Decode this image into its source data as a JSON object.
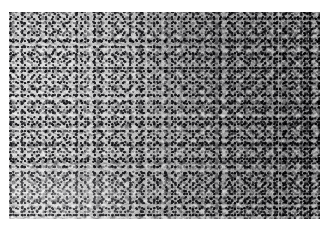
{
  "figure": {
    "kind": "histopathology-micrograph",
    "stain": "H&E",
    "rendering": "grayscale",
    "caption": "",
    "label": "",
    "scale_bar_text": "",
    "magnification_text": ""
  },
  "plate": {
    "background_color": "#ffffff",
    "frame": {
      "left_px": 9,
      "top_px": 12,
      "width_px": 311,
      "height_px": 207
    },
    "tone": {
      "lightest_gray": "#c8c8c8",
      "mid_gray": "#a8a8a8",
      "dark_gray": "#8f8f8f",
      "nuclei_gray": "#1e1e22",
      "highlight_white": "#fdfdfd"
    }
  },
  "regions": [
    {
      "name": "left-fascicular-field",
      "description": "spindle-cell fascicles streaming obliquely, paler stroma",
      "relative_x": 0.18,
      "relative_y": 0.5
    },
    {
      "name": "central-transition-field",
      "description": "mixed fascicular and sheet-like cellular areas",
      "relative_x": 0.5,
      "relative_y": 0.5
    },
    {
      "name": "right-hypercellular-field",
      "description": "densely packed hyperchromatic nuclei, sheet-like growth",
      "relative_x": 0.85,
      "relative_y": 0.5
    },
    {
      "name": "lower-left-pale-cleft",
      "description": "pale linear cleft / stromal band in lower-left quadrant",
      "relative_x": 0.16,
      "relative_y": 0.83
    }
  ]
}
